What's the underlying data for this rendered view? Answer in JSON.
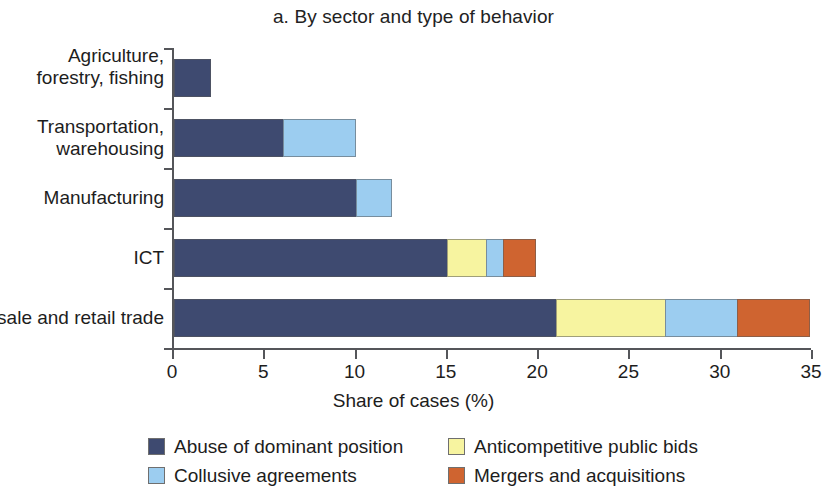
{
  "chart_data": {
    "type": "bar",
    "orientation": "horizontal",
    "stacked": true,
    "title": "a. By sector and type of behavior",
    "xlabel": "Share of cases (%)",
    "ylabel": "",
    "xlim": [
      0,
      35
    ],
    "xticks": [
      0,
      5,
      10,
      15,
      20,
      25,
      30,
      35
    ],
    "xtick_labels": [
      "0",
      "5",
      "10",
      "15",
      "20",
      "25",
      "30",
      "35"
    ],
    "grid": false,
    "legend_position": "bottom",
    "categories": [
      "Agriculture, forestry, fishing",
      "Transportation, warehousing",
      "Manufacturing",
      "ICT",
      "Wholesale and retail trade"
    ],
    "series": [
      {
        "name": "Abuse of dominant position",
        "color": "#3e4a70",
        "values": [
          2,
          6,
          10,
          15,
          21
        ]
      },
      {
        "name": "Anticompetitive public bids",
        "color": "#f7f4a0",
        "values": [
          0,
          0,
          0,
          2.2,
          6
        ]
      },
      {
        "name": "Collusive agreements",
        "color": "#9ccdf0",
        "values": [
          0,
          4,
          2,
          1,
          4
        ]
      },
      {
        "name": "Mergers and acquisitions",
        "color": "#cf6430",
        "values": [
          0,
          0,
          0,
          1.8,
          4
        ]
      }
    ],
    "totals": [
      2,
      10,
      12,
      20,
      35
    ]
  }
}
